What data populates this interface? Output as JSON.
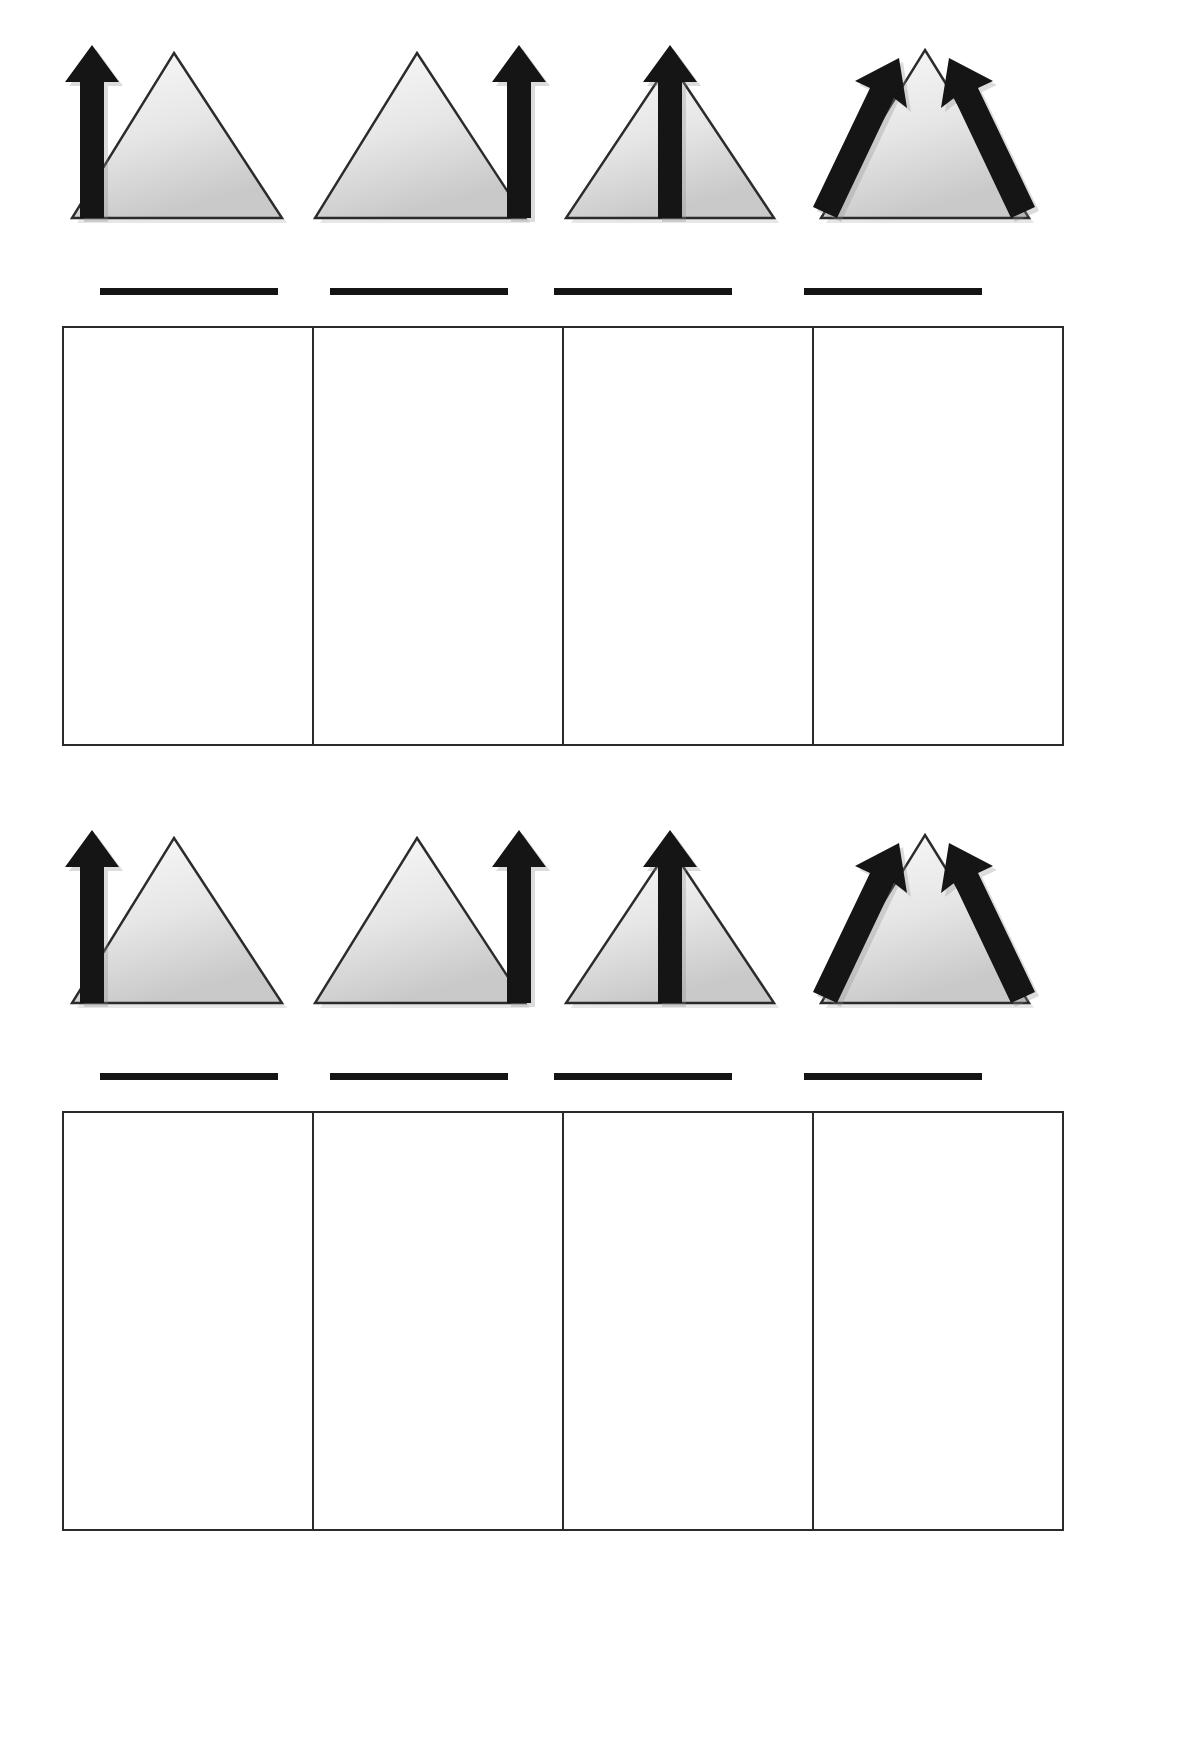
{
  "document": {
    "type": "worksheet",
    "background_color": "#ffffff",
    "page_width": 1182,
    "page_height": 1738,
    "section_count": 2
  },
  "palette": {
    "arrow_black": "#151515",
    "triangle_fill_light": "#f2f2f2",
    "triangle_fill_dark": "#cdcdcd",
    "triangle_stroke": "#2b2b2b",
    "table_border": "#2b2b2b",
    "line_color": "#151515"
  },
  "sections": [
    {
      "id": "section-1",
      "top": 40,
      "icons": [
        {
          "id": "icon-arrow-left-of-triangle",
          "name": "triangle-with-arrow-left",
          "description": "Grey triangle with a thick black upward arrow positioned to its left side",
          "arrow_position": "left",
          "arrow_count": 1,
          "arrow_direction": "up"
        },
        {
          "id": "icon-arrow-right-of-triangle",
          "name": "triangle-with-arrow-right",
          "description": "Grey triangle with a thick black upward arrow positioned to its right side",
          "arrow_position": "right",
          "arrow_count": 1,
          "arrow_direction": "up"
        },
        {
          "id": "icon-arrow-through-center",
          "name": "triangle-with-arrow-center",
          "description": "Grey triangle with a thick black upward arrow through its vertical centre",
          "arrow_position": "center",
          "arrow_count": 1,
          "arrow_direction": "up"
        },
        {
          "id": "icon-two-diagonal-arrows",
          "name": "triangle-with-two-diagonal-arrows",
          "description": "Grey triangle with two thick black arrows running diagonally up along both slopes toward the apex",
          "arrow_position": "both-slopes",
          "arrow_count": 2,
          "arrow_direction": "up-diagonal"
        }
      ],
      "answer_lines": [
        {
          "id": "answer-line-1",
          "text": ""
        },
        {
          "id": "answer-line-2",
          "text": ""
        },
        {
          "id": "answer-line-3",
          "text": ""
        },
        {
          "id": "answer-line-4",
          "text": ""
        }
      ],
      "table": {
        "id": "answer-table-1",
        "columns": 4,
        "rows": 1,
        "cells": [
          "",
          "",
          "",
          ""
        ]
      }
    },
    {
      "id": "section-2",
      "top": 830,
      "icons": [
        {
          "id": "icon-arrow-left-of-triangle-2",
          "name": "triangle-with-arrow-left",
          "description": "Grey triangle with a thick black upward arrow positioned to its left side",
          "arrow_position": "left",
          "arrow_count": 1,
          "arrow_direction": "up"
        },
        {
          "id": "icon-arrow-right-of-triangle-2",
          "name": "triangle-with-arrow-right",
          "description": "Grey triangle with a thick black upward arrow positioned to its right side",
          "arrow_position": "right",
          "arrow_count": 1,
          "arrow_direction": "up"
        },
        {
          "id": "icon-arrow-through-center-2",
          "name": "triangle-with-arrow-center",
          "description": "Grey triangle with a thick black upward arrow through its vertical centre",
          "arrow_position": "center",
          "arrow_count": 1,
          "arrow_direction": "up"
        },
        {
          "id": "icon-two-diagonal-arrows-2",
          "name": "triangle-with-two-diagonal-arrows",
          "description": "Grey triangle with two thick black arrows running diagonally up along both slopes toward the apex",
          "arrow_position": "both-slopes",
          "arrow_count": 2,
          "arrow_direction": "up-diagonal"
        }
      ],
      "answer_lines": [
        {
          "id": "answer-line-5",
          "text": ""
        },
        {
          "id": "answer-line-6",
          "text": ""
        },
        {
          "id": "answer-line-7",
          "text": ""
        },
        {
          "id": "answer-line-8",
          "text": ""
        }
      ],
      "table": {
        "id": "answer-table-2",
        "columns": 4,
        "rows": 1,
        "cells": [
          "",
          "",
          "",
          ""
        ]
      }
    }
  ]
}
